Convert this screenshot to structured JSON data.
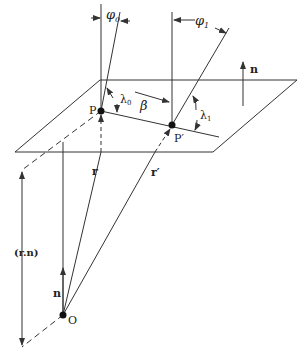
{
  "diagram": {
    "colors": {
      "stroke": "#333333",
      "text": "#222222",
      "background": "#ffffff"
    },
    "labels": {
      "phi0": "φ",
      "phi0_sub": "0",
      "phi1": "φ",
      "phi1_sub": "1",
      "lambda0": "λ",
      "lambda0_sub": "0",
      "lambda1": "λ",
      "lambda1_sub": "1",
      "beta": "β",
      "n_plane": "n",
      "P": "P",
      "P_prime": "P′",
      "r": "r",
      "r_prime": "r′",
      "rn": "(r.n)",
      "n_origin": "n",
      "O": "O"
    }
  }
}
